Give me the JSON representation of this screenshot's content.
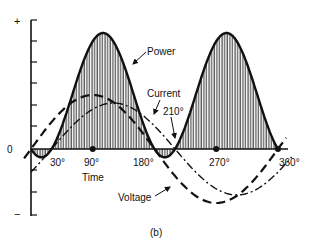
{
  "figure": {
    "caption": "(b)",
    "axis": {
      "plus_label": "+",
      "zero_label": "0",
      "minus_label": "−",
      "x_label": "Time"
    },
    "angle_labels": {
      "a30": "30°",
      "a90": "90°",
      "a180": "180°",
      "a210": "210°",
      "a270": "270°",
      "a360": "360°"
    },
    "curve_labels": {
      "power": "Power",
      "current": "Current",
      "voltage": "Voltage"
    },
    "colors": {
      "ink": "#111111",
      "background": "#ffffff"
    }
  },
  "chart_data": {
    "type": "line",
    "title": "",
    "caption": "(b)",
    "xlabel": "Time",
    "ylabel": "",
    "x_unit": "degrees",
    "x_ticks": [
      30,
      90,
      180,
      270,
      360
    ],
    "x_tick_labels": [
      "30°",
      "90°",
      "180°",
      "270°",
      "360°"
    ],
    "annotations": [
      "210°",
      "Power",
      "Current",
      "Voltage"
    ],
    "y_axis_labels": [
      "+",
      "0",
      "−"
    ],
    "series": [
      {
        "name": "Voltage",
        "style": "dashed",
        "formula": "Vm*sin(θ)",
        "amplitude_rel": 1.0,
        "phase_deg": 0
      },
      {
        "name": "Current",
        "style": "dash-dot",
        "formula": "Im*sin(θ−30°)",
        "amplitude_rel": 0.9,
        "phase_deg": -30
      },
      {
        "name": "Power",
        "style": "solid, hatched fill",
        "formula": "v·i",
        "peak_at_deg": [
          105,
          285
        ],
        "negative_intervals_deg": [
          [
            0,
            30
          ],
          [
            180,
            210
          ]
        ]
      }
    ],
    "marked_points_deg": [
      90,
      270,
      360
    ],
    "xlim": [
      0,
      360
    ],
    "grid": false,
    "legend": "inline labels with arrows"
  }
}
